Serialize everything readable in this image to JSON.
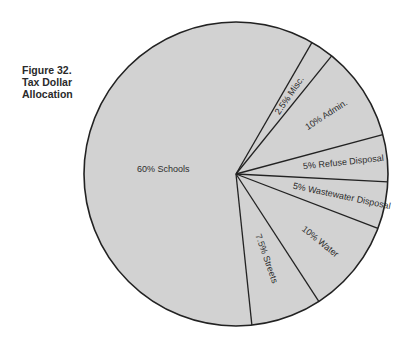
{
  "figure": {
    "number": "Figure 32.",
    "title_lines": [
      "Tax Dollar",
      "Allocation"
    ]
  },
  "colors": {
    "slice_fill": "#d2d2d2",
    "outline": "#222222",
    "text": "#2d2d2d"
  },
  "chart_data": {
    "type": "pie",
    "title": "Figure 32. Tax Dollar Allocation",
    "start_angle_deg_clockwise_from_top": 30,
    "categories": [
      "Misc.",
      "Admin.",
      "Refuse Disposal",
      "Wastewater Disposal",
      "Water",
      "Streets",
      "Schools"
    ],
    "values": [
      2.5,
      10,
      5,
      5,
      10,
      7.5,
      60
    ],
    "labels": [
      "2.5% Misc.",
      "10% Admin.",
      "5% Refuse Disposal",
      "5% Wastewater Disposal",
      "10% Water",
      "7.5% Streets",
      "60% Schools"
    ],
    "unit": "%",
    "legend": "none (labels inside slices)",
    "grid": false
  }
}
